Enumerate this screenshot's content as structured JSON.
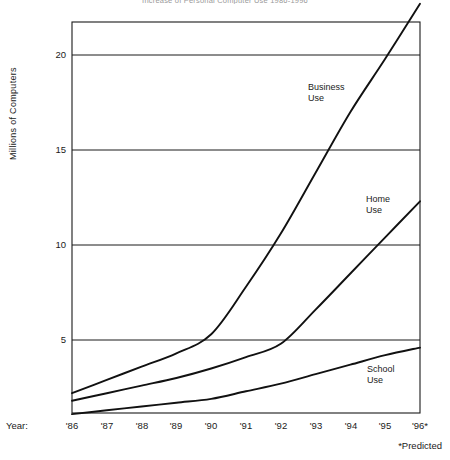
{
  "chart_data": {
    "type": "line",
    "title": "Increase of Personal Computer Use 1986-1996",
    "xlabel": "Year:",
    "ylabel": "Millions of Computers",
    "x": [
      "'86",
      "'87",
      "'88",
      "'89",
      "'90",
      "'91",
      "'92",
      "'93",
      "'94",
      "'95",
      "'96*"
    ],
    "xlim": [
      1986,
      1996
    ],
    "ylim": [
      1.1,
      22.7
    ],
    "yticks": [
      5,
      10,
      15,
      20
    ],
    "ytick_labels": [
      "5",
      "10",
      "15",
      "20"
    ],
    "grid": "horizontal",
    "legend": "inline-labels",
    "footnote": "*Predicted",
    "series": [
      {
        "name": "Business Use",
        "label_text": "Business\nUse",
        "values": [
          2.2,
          2.9,
          3.6,
          4.3,
          5.3,
          7.8,
          10.6,
          13.8,
          17.0,
          19.8,
          22.7
        ],
        "color": "#111111"
      },
      {
        "name": "Home Use",
        "label_text": "Home\nUse",
        "values": [
          1.8,
          2.2,
          2.6,
          3.0,
          3.5,
          4.1,
          4.8,
          6.6,
          8.5,
          10.4,
          12.3
        ],
        "color": "#111111"
      },
      {
        "name": "School Use",
        "label_text": "School\nUse",
        "values": [
          1.1,
          1.3,
          1.5,
          1.7,
          1.9,
          2.3,
          2.7,
          3.2,
          3.7,
          4.2,
          4.6
        ],
        "color": "#111111"
      }
    ]
  },
  "axis": {
    "y_label": "Millions of Computers",
    "x_prefix": "Year:",
    "tick_20": "20",
    "tick_15": "15",
    "tick_10": "10",
    "tick_5": "5",
    "x0": "'86",
    "x1": "'87",
    "x2": "'88",
    "x3": "'89",
    "x4": "'90",
    "x5": "'91",
    "x6": "'92",
    "x7": "'93",
    "x8": "'94",
    "x9": "'95",
    "x10": "'96*"
  },
  "labels": {
    "business": "Business\nUse",
    "home": "Home\nUse",
    "school": "School\nUse"
  },
  "footnote": "*Predicted",
  "title": "Increase of Personal Computer Use 1986-1996",
  "colors": {
    "line": "#111111",
    "frame": "#1a1a1a",
    "grid": "#1a1a1a",
    "background": "#ffffff"
  }
}
